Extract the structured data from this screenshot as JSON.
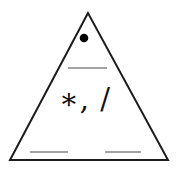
{
  "figure": {
    "type": "fact-family-triangle-diagram",
    "operators_label": "∗, /",
    "top_marker_icon": "filled-circle",
    "blank_line_count": 3,
    "colors": {
      "outline": "#1c1c1c",
      "dot": "#000000",
      "blank_line": "#858585",
      "background": "#ffffff"
    }
  }
}
